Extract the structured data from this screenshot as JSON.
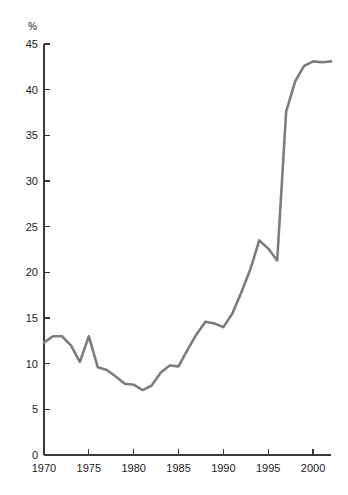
{
  "chart_data": {
    "type": "line",
    "title": "",
    "subtitle": "",
    "xlabel": "",
    "ylabel": "%",
    "unit_label": "%",
    "xlim": [
      1970,
      2002
    ],
    "ylim": [
      0,
      45
    ],
    "grid": false,
    "legend": "none",
    "line_color": "#7d7d7d",
    "axis_color": "#3a3a3a",
    "background": "#ffffff",
    "y_ticks": [
      0,
      5,
      10,
      15,
      20,
      25,
      30,
      35,
      40,
      45
    ],
    "y_tick_labels": [
      "0",
      "5",
      "10",
      "15",
      "20",
      "25",
      "30",
      "35",
      "40",
      "45"
    ],
    "x_ticks": [
      1970,
      1975,
      1980,
      1985,
      1990,
      1995,
      2000
    ],
    "x_tick_labels": [
      "1970",
      "1975",
      "1980",
      "1985",
      "1990",
      "1995",
      "2000"
    ],
    "series": [
      {
        "name": "value",
        "x": [
          1970,
          1971,
          1972,
          1973,
          1974,
          1975,
          1976,
          1977,
          1978,
          1979,
          1980,
          1981,
          1982,
          1983,
          1984,
          1985,
          1986,
          1987,
          1988,
          1989,
          1990,
          1991,
          1992,
          1993,
          1994,
          1995,
          1996,
          1997,
          1998,
          1999,
          2000,
          2001,
          2002
        ],
        "values": [
          12.3,
          13.0,
          13.0,
          12.0,
          10.2,
          13.0,
          9.6,
          9.3,
          8.6,
          7.8,
          7.7,
          7.1,
          7.6,
          9.0,
          9.8,
          9.7,
          11.5,
          13.2,
          14.6,
          14.4,
          14.0,
          15.5,
          17.8,
          20.3,
          23.5,
          22.6,
          21.3,
          37.6,
          40.9,
          42.6,
          43.1,
          43.0,
          43.1
        ]
      }
    ]
  },
  "caption": {
    "text": ""
  }
}
